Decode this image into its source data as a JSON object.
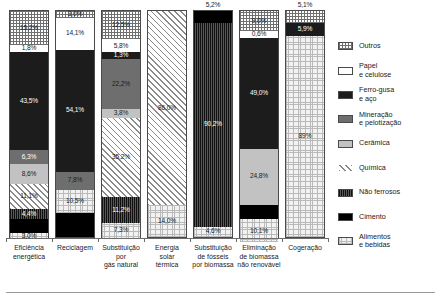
{
  "chart_data": {
    "type": "bar",
    "title": "",
    "xlabel": "",
    "ylabel": "",
    "ylim": [
      0,
      100
    ],
    "stacked": true,
    "normalized_percent": true,
    "grid": false,
    "legend_position": "right",
    "categories": [
      "Eficiência\nenergética",
      "Reciclagem",
      "Substituição\npor\ngás natural",
      "Energia\nsolar\ntérmica",
      "Substituição\nde fósseis\npor biomassa",
      "Eliminação\nde biomassa\nnão renovável",
      "Cogeração"
    ],
    "series": [
      {
        "name": "Outros",
        "key": "outros",
        "color": "#ffffff",
        "pattern": "grid-crosshatch",
        "values": [
          15.2,
          3.0,
          12.5,
          0,
          0,
          9.0,
          5.1
        ]
      },
      {
        "name": "Papel e celulose",
        "key": "papel",
        "color": "#ffffff",
        "pattern": "solid-white",
        "values": [
          1.8,
          14.1,
          5.8,
          0,
          0,
          0.6,
          0
        ]
      },
      {
        "name": "Ferro-gusa e aço",
        "key": "ferro",
        "color": "#1c1c1c",
        "pattern": "solid-black",
        "values": [
          43.5,
          54.1,
          1.3,
          0,
          0,
          49.0,
          5.9
        ]
      },
      {
        "name": "Mineração e pelotização",
        "key": "miner",
        "color": "#6e6e6e",
        "pattern": "solid-darkgray",
        "values": [
          6.3,
          7.8,
          22.2,
          0,
          0,
          0,
          0
        ]
      },
      {
        "name": "Cerâmica",
        "key": "ceramica",
        "color": "#c2c2c2",
        "pattern": "solid-lightgray",
        "values": [
          8.6,
          0,
          3.8,
          0,
          0,
          24.8,
          0
        ]
      },
      {
        "name": "Química",
        "key": "quimica",
        "color": "#ffffff",
        "pattern": "diagonal-hatch",
        "values": [
          11.1,
          0,
          35.2,
          86.0,
          0,
          0,
          0
        ]
      },
      {
        "name": "Não ferrosos",
        "key": "naoferr",
        "color": "#3a3a3a",
        "pattern": "vertical-stripe",
        "values": [
          4.4,
          0,
          11.2,
          0,
          90.2,
          0,
          0
        ]
      },
      {
        "name": "Cimento",
        "key": "cimento",
        "color": "#000000",
        "pattern": "solid-black",
        "values": [
          6.1,
          10.5,
          0,
          0,
          5.2,
          6.5,
          0
        ]
      },
      {
        "name": "Alimentos e bebidas",
        "key": "alim",
        "color": "#f2f2f2",
        "pattern": "dotted-grid",
        "values": [
          3.0,
          10.5,
          7.3,
          14.0,
          4.6,
          10.1,
          89.0
        ]
      }
    ]
  },
  "bars": [
    {
      "category": "Eficiência energética",
      "segments": [
        {
          "key": "outros",
          "label": "15,2%",
          "value": 15.2,
          "text": "light",
          "outside": false
        },
        {
          "key": "papel",
          "label": "1,8%",
          "value": 1.8,
          "text": "light",
          "outside": false
        },
        {
          "key": "ferro",
          "label": "43,5%",
          "value": 43.5,
          "text": "dark",
          "outside": false
        },
        {
          "key": "miner",
          "label": "6,3%",
          "value": 6.3,
          "text": "dark",
          "outside": false
        },
        {
          "key": "ceramica",
          "label": "8,6%",
          "value": 8.6,
          "text": "light",
          "outside": false
        },
        {
          "key": "quimica",
          "label": "11,1%",
          "value": 11.1,
          "text": "light",
          "outside": false
        },
        {
          "key": "naoferr",
          "label": "4,4%",
          "value": 4.4,
          "text": "dark",
          "outside": false
        },
        {
          "key": "cimento",
          "label": "",
          "value": 6.1,
          "text": "dark",
          "outside": false
        },
        {
          "key": "alim",
          "label": "3,0%",
          "value": 3.0,
          "text": "light",
          "outside": false
        }
      ]
    },
    {
      "category": "Reciclagem",
      "segments": [
        {
          "key": "outros",
          "label": "3,0%",
          "value": 3.0,
          "text": "light",
          "outside": false
        },
        {
          "key": "papel",
          "label": "14,1%",
          "value": 14.1,
          "text": "light",
          "outside": false
        },
        {
          "key": "ferro",
          "label": "54,1%",
          "value": 54.1,
          "text": "dark",
          "outside": false
        },
        {
          "key": "miner",
          "label": "7,8%",
          "value": 7.8,
          "text": "light",
          "outside": false
        },
        {
          "key": "alim",
          "label": "10,5%",
          "value": 10.5,
          "text": "light",
          "outside": false
        },
        {
          "key": "cimento",
          "label": "",
          "value": 10.5,
          "text": "dark",
          "outside": false
        }
      ]
    },
    {
      "category": "Substituição por gás natural",
      "segments": [
        {
          "key": "outros",
          "label": "12,5%",
          "value": 12.5,
          "text": "light",
          "outside": false
        },
        {
          "key": "papel",
          "label": "5,8%",
          "value": 5.8,
          "text": "light",
          "outside": false
        },
        {
          "key": "ferro",
          "label": "1,3%",
          "value": 1.3,
          "text": "dark",
          "outside": false
        },
        {
          "key": "miner",
          "label": "22,2%",
          "value": 22.2,
          "text": "light",
          "outside": false
        },
        {
          "key": "ceramica",
          "label": "3,8%",
          "value": 3.8,
          "text": "light",
          "outside": false
        },
        {
          "key": "quimica",
          "label": "35,2%",
          "value": 35.2,
          "text": "light",
          "outside": false
        },
        {
          "key": "naoferr",
          "label": "11,2%",
          "value": 11.2,
          "text": "dark",
          "outside": false
        },
        {
          "key": "alim",
          "label": "7,3%",
          "value": 7.3,
          "text": "light",
          "outside": false
        }
      ]
    },
    {
      "category": "Energia solar térmica",
      "segments": [
        {
          "key": "quimica",
          "label": "86,0%",
          "value": 86.0,
          "text": "light",
          "outside": false
        },
        {
          "key": "alim",
          "label": "14,0%",
          "value": 14.0,
          "text": "light",
          "outside": false
        }
      ]
    },
    {
      "category": "Substituição de fósseis por biomassa",
      "segments": [
        {
          "key": "cimento",
          "label": "5,2%",
          "value": 5.2,
          "text": "light",
          "outside": true
        },
        {
          "key": "naoferr",
          "label": "90,2%",
          "value": 90.2,
          "text": "dark",
          "outside": false
        },
        {
          "key": "alim",
          "label": "4,6%",
          "value": 4.6,
          "text": "light",
          "outside": false
        }
      ]
    },
    {
      "category": "Eliminação de biomassa não renovável",
      "segments": [
        {
          "key": "outros",
          "label": "9,0%",
          "value": 9.0,
          "text": "light",
          "outside": false
        },
        {
          "key": "papel",
          "label": "0,6%",
          "value": 0.6,
          "text": "light",
          "outside": false
        },
        {
          "key": "ferro",
          "label": "49,0%",
          "value": 49.0,
          "text": "dark",
          "outside": false
        },
        {
          "key": "ceramica",
          "label": "24,8%",
          "value": 24.8,
          "text": "light",
          "outside": false
        },
        {
          "key": "cimento",
          "label": "",
          "value": 6.5,
          "text": "dark",
          "outside": false
        },
        {
          "key": "alim",
          "label": "10,1%",
          "value": 10.1,
          "text": "light",
          "outside": false
        }
      ]
    },
    {
      "category": "Cogeração",
      "segments": [
        {
          "key": "outros",
          "label": "5,1%",
          "value": 5.1,
          "text": "light",
          "outside": true
        },
        {
          "key": "ferro",
          "label": "5,9%",
          "value": 5.9,
          "text": "dark",
          "outside": false
        },
        {
          "key": "alim",
          "label": "89%",
          "value": 89.0,
          "text": "light",
          "outside": false
        }
      ]
    }
  ],
  "legend": {
    "items": [
      {
        "label": "Outros",
        "key": "outros"
      },
      {
        "label": "Papel\ne celulose",
        "key": "papel"
      },
      {
        "label": "Ferro-gusa\ne aço",
        "key": "ferro"
      },
      {
        "label": "Mineração\ne pelotização",
        "key": "miner"
      },
      {
        "label": "Cerâmica",
        "key": "ceramica"
      },
      {
        "label": "Química",
        "key": "quimica"
      },
      {
        "label": "Não ferrosos",
        "key": "naoferr"
      },
      {
        "label": "Cimento",
        "key": "cimento"
      },
      {
        "label": "Alimentos\ne bebidas",
        "key": "alim"
      }
    ]
  }
}
